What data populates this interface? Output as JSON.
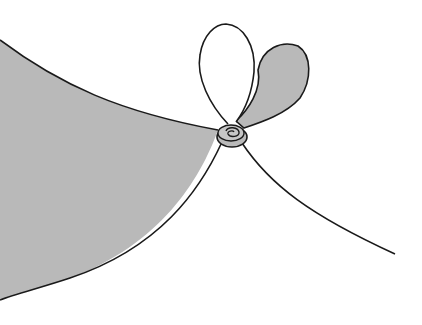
{
  "figure": {
    "colors": {
      "background": "#ffffff",
      "shade": "#b9b9b9",
      "stroke": "#1a1a1a"
    }
  }
}
